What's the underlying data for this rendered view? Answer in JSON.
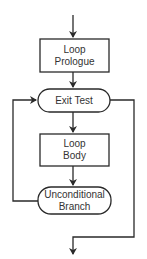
{
  "diagram": {
    "type": "flowchart",
    "nodes": {
      "prologue": {
        "line1": "Loop",
        "line2": "Prologue",
        "shape": "rectangle"
      },
      "exit_test": {
        "label": "Exit Test",
        "shape": "rounded-pill"
      },
      "body": {
        "line1": "Loop",
        "line2": "Body",
        "shape": "rectangle"
      },
      "branch": {
        "line1": "Unconditional",
        "line2": "Branch",
        "shape": "rounded-pill"
      }
    },
    "edges": [
      {
        "from": "entry",
        "to": "prologue"
      },
      {
        "from": "prologue",
        "to": "exit_test"
      },
      {
        "from": "exit_test",
        "to": "body"
      },
      {
        "from": "body",
        "to": "branch"
      },
      {
        "from": "branch",
        "to": "exit_test",
        "route": "left-loop-back"
      },
      {
        "from": "exit_test",
        "to": "exit",
        "route": "right-side-down"
      }
    ],
    "colors": {
      "line": "#2a2a2a",
      "background": "#ffffff",
      "text": "#333333"
    }
  }
}
